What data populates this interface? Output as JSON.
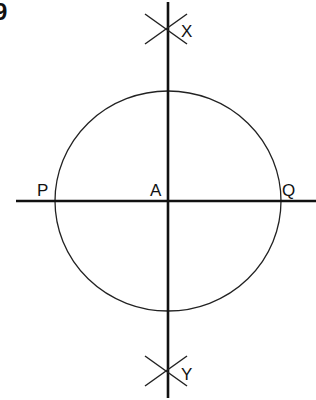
{
  "figure": {
    "number_fragment": "9",
    "stroke_color": "#111111",
    "background": "#ffffff"
  },
  "diagram": {
    "center": {
      "label": "A",
      "x": 168,
      "y": 201
    },
    "circle": {
      "cx": 168,
      "cy": 201,
      "r": 112
    },
    "horizontal_line": {
      "x1": 16,
      "x2": 316,
      "y": 201
    },
    "vertical_line": {
      "x": 168,
      "y1": 0,
      "y2": 400
    },
    "points": [
      {
        "label": "P",
        "x": 55,
        "y": 201
      },
      {
        "label": "Q",
        "x": 280,
        "y": 201
      },
      {
        "label": "X",
        "x": 168,
        "y": 29
      },
      {
        "label": "Y",
        "x": 168,
        "y": 372
      }
    ],
    "arc_crossings": [
      {
        "at": "X",
        "x": 168,
        "y": 29
      },
      {
        "at": "Y",
        "x": 168,
        "y": 372
      }
    ]
  },
  "labels": {
    "P": "P",
    "A": "A",
    "Q": "Q",
    "X": "X",
    "Y": "Y",
    "fig": "9"
  }
}
